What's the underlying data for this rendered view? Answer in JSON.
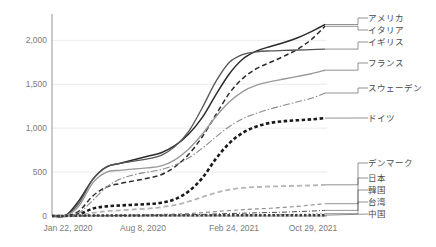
{
  "chart_data": {
    "type": "line",
    "title": "",
    "xlabel": "",
    "ylabel": "",
    "ylim": [
      0,
      2300
    ],
    "yticks": [
      0,
      500,
      1000,
      1500,
      2000
    ],
    "ytick_labels": [
      "0",
      "500",
      "1,000",
      "1,500",
      "2,000"
    ],
    "xtick_labels": [
      "Jan 22, 2020",
      "Aug 8, 2020",
      "Feb 24, 2021",
      "Oct 29, 2021"
    ],
    "xtick_positions": [
      0,
      0.3333,
      0.6667,
      1.0
    ],
    "grid": true,
    "legend_position": "right",
    "x_count": 21,
    "series": [
      {
        "name": "アメリカ",
        "label": "アメリカ",
        "color": "#2b2b2b",
        "width": 1.5,
        "dash": "none",
        "values": [
          0,
          5,
          180,
          420,
          560,
          600,
          640,
          680,
          720,
          800,
          930,
          1120,
          1380,
          1620,
          1790,
          1880,
          1930,
          1975,
          2030,
          2100,
          2180
        ]
      },
      {
        "name": "イタリア",
        "label": "イタリア",
        "color": "#2b2b2b",
        "width": 1.5,
        "dash": "5,3",
        "values": [
          0,
          2,
          60,
          230,
          330,
          370,
          400,
          430,
          470,
          560,
          700,
          900,
          1150,
          1400,
          1570,
          1680,
          1750,
          1820,
          1900,
          2010,
          2160
        ]
      },
      {
        "name": "イギリス",
        "label": "イギリス",
        "color": "#555555",
        "width": 1.3,
        "dash": "none",
        "values": [
          0,
          3,
          150,
          420,
          560,
          600,
          625,
          650,
          690,
          790,
          960,
          1230,
          1530,
          1750,
          1840,
          1870,
          1880,
          1885,
          1890,
          1895,
          1900
        ]
      },
      {
        "name": "フランス",
        "label": "フランス",
        "color": "#9a9a9a",
        "width": 1.4,
        "dash": "none",
        "values": [
          0,
          2,
          120,
          380,
          500,
          520,
          535,
          548,
          570,
          640,
          760,
          930,
          1130,
          1300,
          1420,
          1490,
          1530,
          1560,
          1590,
          1620,
          1660
        ]
      },
      {
        "name": "スウェーデン",
        "label": "スウェーデン",
        "color": "#8a8a8a",
        "width": 1.1,
        "dash": "7,2,1.5,2",
        "values": [
          0,
          1,
          40,
          180,
          330,
          420,
          470,
          500,
          530,
          580,
          660,
          770,
          900,
          1020,
          1110,
          1170,
          1220,
          1260,
          1300,
          1340,
          1400
        ]
      },
      {
        "name": "ドイツ",
        "label": "ドイツ",
        "color": "#1a1a1a",
        "width": 2.6,
        "dash": "3.5,2.5",
        "values": [
          0,
          1,
          20,
          85,
          110,
          120,
          128,
          136,
          150,
          190,
          280,
          430,
          650,
          830,
          950,
          1020,
          1060,
          1080,
          1090,
          1100,
          1115
        ]
      },
      {
        "name": "デンマーク",
        "label": "デンマーク",
        "color": "#b5b5b5",
        "width": 1.8,
        "dash": "5,3",
        "values": [
          0,
          0,
          10,
          35,
          55,
          65,
          75,
          85,
          100,
          125,
          165,
          215,
          265,
          300,
          320,
          330,
          336,
          340,
          344,
          348,
          355
        ]
      },
      {
        "name": "日本",
        "label": "日本",
        "color": "#8f8f8f",
        "width": 1.2,
        "dash": "4,3",
        "values": [
          0,
          0,
          2,
          6,
          8,
          10,
          12,
          14,
          17,
          21,
          28,
          38,
          50,
          62,
          72,
          80,
          88,
          98,
          110,
          125,
          140
        ]
      },
      {
        "name": "韓国",
        "label": "韓国",
        "color": "#4a4a4a",
        "width": 1.0,
        "dash": "5,2,1,2",
        "values": [
          0,
          0,
          1,
          3,
          5,
          6,
          7,
          8,
          9,
          11,
          14,
          18,
          23,
          28,
          32,
          36,
          40,
          44,
          50,
          56,
          64
        ]
      },
      {
        "name": "台湾",
        "label": "台湾",
        "color": "#9e9e9e",
        "width": 1.0,
        "dash": "2,2",
        "values": [
          0,
          0,
          0,
          1,
          1,
          1,
          2,
          2,
          2,
          3,
          4,
          5,
          7,
          9,
          11,
          13,
          15,
          17,
          19,
          22,
          26
        ]
      },
      {
        "name": "中国",
        "label": "中国",
        "color": "#3d3d3d",
        "width": 2.4,
        "dash": "2.5,2",
        "values": [
          0,
          1,
          4,
          6,
          6,
          6,
          6,
          7,
          7,
          7,
          7,
          7,
          8,
          8,
          8,
          8,
          8,
          8,
          8,
          9,
          9
        ]
      }
    ],
    "legend_entries": [
      {
        "label": "アメリカ",
        "y": 18
      },
      {
        "label": "イタリア",
        "y": 30
      },
      {
        "label": "イギリス",
        "y": 42
      },
      {
        "label": "フランス",
        "y": 63
      },
      {
        "label": "スウェーデン",
        "y": 88
      },
      {
        "label": "ドイツ",
        "y": 118
      },
      {
        "label": "デンマーク",
        "y": 163
      },
      {
        "label": "日本",
        "y": 178
      },
      {
        "label": "韓国",
        "y": 190
      },
      {
        "label": "台湾",
        "y": 202
      },
      {
        "label": "中国",
        "y": 214
      }
    ]
  }
}
